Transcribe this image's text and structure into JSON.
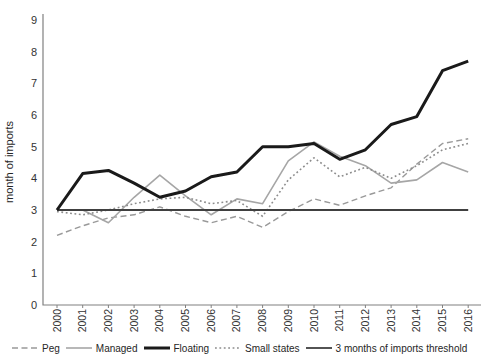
{
  "figure": {
    "y_axis_title": "month of imports"
  },
  "chart_data": {
    "type": "line",
    "title": "",
    "xlabel": "",
    "ylabel": "month of imports",
    "ylim": [
      0,
      9
    ],
    "yticks": [
      0,
      1,
      2,
      3,
      4,
      5,
      6,
      7,
      8,
      9
    ],
    "grid": false,
    "legend_position": "bottom",
    "x": [
      2000,
      2001,
      2002,
      2003,
      2004,
      2005,
      2006,
      2007,
      2008,
      2009,
      2010,
      2011,
      2012,
      2013,
      2014,
      2015,
      2016
    ],
    "series": [
      {
        "name": "Peg",
        "style": "dashed",
        "color": "#999999",
        "width": 1.4,
        "values": [
          2.2,
          2.5,
          2.75,
          2.85,
          3.1,
          2.8,
          2.6,
          2.8,
          2.45,
          2.95,
          3.35,
          3.15,
          3.45,
          3.7,
          4.45,
          5.1,
          5.25
        ]
      },
      {
        "name": "Managed",
        "style": "solid",
        "color": "#a6a6a6",
        "width": 1.6,
        "values": [
          3.0,
          3.0,
          2.6,
          3.4,
          4.1,
          3.45,
          2.85,
          3.35,
          3.2,
          4.55,
          5.15,
          4.7,
          4.4,
          3.85,
          3.95,
          4.5,
          4.2
        ]
      },
      {
        "name": "Floating",
        "style": "solid",
        "color": "#1a1a1a",
        "width": 3,
        "values": [
          3.0,
          4.15,
          4.25,
          3.85,
          3.4,
          3.6,
          4.05,
          4.2,
          5.0,
          5.0,
          5.1,
          4.6,
          4.9,
          5.7,
          5.95,
          7.4,
          7.7
        ]
      },
      {
        "name": "Small states",
        "style": "dotted",
        "color": "#8c8c8c",
        "width": 1.6,
        "values": [
          2.95,
          2.85,
          3.0,
          3.2,
          3.35,
          3.4,
          3.2,
          3.3,
          2.8,
          3.95,
          4.65,
          4.05,
          4.35,
          4.0,
          4.4,
          4.9,
          5.1
        ]
      },
      {
        "name": "3 months of imports threshold",
        "style": "solid",
        "color": "#404040",
        "width": 1.8,
        "values": [
          3,
          3,
          3,
          3,
          3,
          3,
          3,
          3,
          3,
          3,
          3,
          3,
          3,
          3,
          3,
          3,
          3
        ]
      }
    ]
  }
}
